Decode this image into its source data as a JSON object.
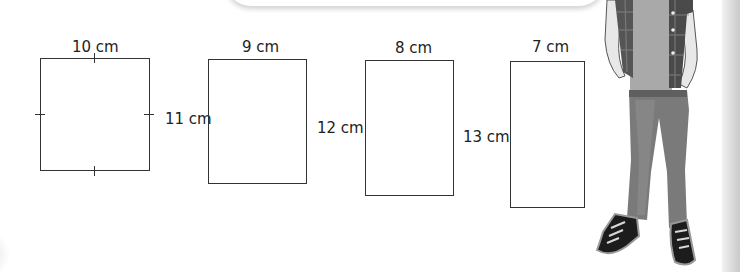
{
  "figure": {
    "type": "geometry-worksheet",
    "shapes": [
      {
        "name": "square",
        "top_label": "10 cm",
        "side_label": "",
        "tick_marks": true
      },
      {
        "name": "rectangle-a",
        "top_label": "9 cm",
        "side_label": "11 cm",
        "tick_marks": false
      },
      {
        "name": "rectangle-b",
        "top_label": "8 cm",
        "side_label": "12 cm",
        "tick_marks": false
      },
      {
        "name": "rectangle-c",
        "top_label": "7 cm",
        "side_label": "13 cm",
        "tick_marks": false
      }
    ]
  },
  "illustration": {
    "subject": "boy-standing",
    "clothing": [
      "plaid-shirt",
      "grey-tshirt",
      "jeans",
      "sneakers"
    ]
  },
  "colors": {
    "line": "#333333",
    "background": "#ffffff",
    "jeans": "#7a7a7a",
    "shoes": "#1c1c1c"
  }
}
